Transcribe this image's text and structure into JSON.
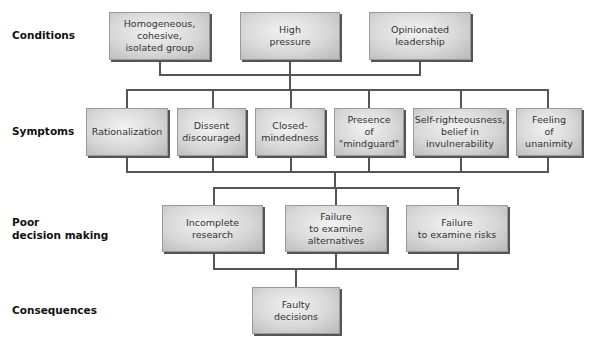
{
  "labels": {
    "conditions": "Conditions",
    "symptoms": "Symptoms",
    "poor_decision_making": "Poor\ndecision making",
    "consequences": "Consequences"
  },
  "conditions": [
    {
      "text": "Homogeneous,\ncohesive,\nisolated group"
    },
    {
      "text": "High\npressure"
    },
    {
      "text": "Opinionated\nleadership"
    }
  ],
  "symptoms": [
    {
      "text": "Rationalization"
    },
    {
      "text": "Dissent\ndiscouraged"
    },
    {
      "text": "Closed-\nmindedness"
    },
    {
      "text": "Presence\nof\n\"mindguard\""
    },
    {
      "text": "Self-righteousness,\nbelief in\ninvulnerability"
    },
    {
      "text": "Feeling\nof\nunanimity"
    }
  ],
  "poor_decision_making": [
    {
      "text": "Incomplete\nresearch"
    },
    {
      "text": "Failure\nto examine\nalternatives"
    },
    {
      "text": "Failure\nto examine risks"
    }
  ],
  "consequences": [
    {
      "text": "Faulty\ndecisions"
    }
  ],
  "colors": {
    "connector": "#555555",
    "box_light": "#f2f2f2",
    "box_dark": "#b8b8b8",
    "shadow": "#555555"
  }
}
